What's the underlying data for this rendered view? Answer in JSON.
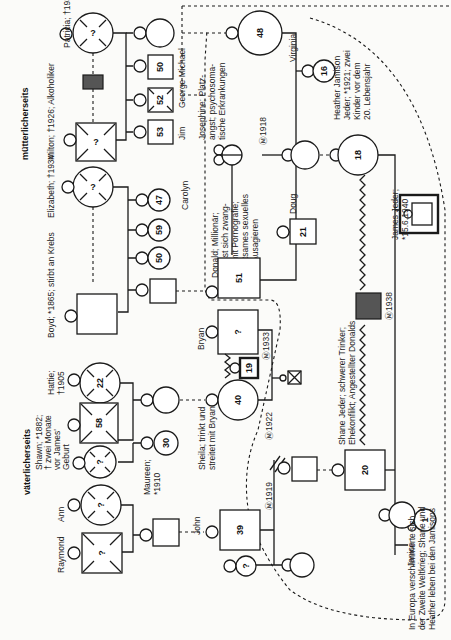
{
  "orientation": "rotated-90-ccw",
  "headers": {
    "maternal": "mütterlicherseits",
    "paternal": "väterlicherseits"
  },
  "persons": {
    "patricia": {
      "label": "Patricia; †1930",
      "age": "?",
      "sex": "female",
      "deceased": true
    },
    "milton": {
      "label": "Milton; †1926; Alkoholiker",
      "age": "?",
      "sex": "male",
      "deceased": true
    },
    "elizabeth": {
      "label": "Elizabeth; †1934",
      "age": "?",
      "sex": "female",
      "deceased": true
    },
    "boyd": {
      "label": "Boyd; *1865; stirbt an Krebs",
      "age": "",
      "sex": "male"
    },
    "hattie": {
      "label": "Hattie; †1905",
      "age": "22",
      "sex": "female",
      "deceased": true
    },
    "shawn": {
      "label": "Shawn; *1882; † zwei Monate vor James' Geburt",
      "age": "58",
      "sex": "male",
      "deceased": true
    },
    "maureen": {
      "label": "Maureen; *1910",
      "age": "30",
      "sex": "female"
    },
    "ann": {
      "label": "Ann",
      "age": "?",
      "sex": "female",
      "deceased": true
    },
    "raymond": {
      "label": "Raymond",
      "age": "?",
      "sex": "male",
      "deceased": true
    },
    "john": {
      "label": "John",
      "age": "",
      "sex": "male"
    },
    "george_michael": {
      "label": "George Michael",
      "age": "50",
      "sex": "male"
    },
    "jim": {
      "label": "Jim",
      "age": "53",
      "sex": "male"
    },
    "sibling_52": {
      "age": "52",
      "sex": "male",
      "deceased": true
    },
    "carolyn": {
      "label": "Carolyn",
      "age": "47",
      "sex": "female"
    },
    "sister_59": {
      "age": "59",
      "sex": "female"
    },
    "sister_50": {
      "age": "50",
      "sex": "female"
    },
    "josephine": {
      "label": "Josephine; Platzangst; psychosomatische Erkrankungen",
      "age": "48",
      "sex": "female"
    },
    "virginia": {
      "label": "Virginia",
      "age": "16",
      "sex": "female"
    },
    "donald": {
      "label": "Donald; Millionär; befasst sich zwanghaft mit Pornografie; seltsames sexuelles Ausagieren",
      "age": "51",
      "sex": "male"
    },
    "doug": {
      "label": "Doug",
      "age": "21",
      "sex": "male"
    },
    "heather": {
      "label": "Heather Jamison Jeder; *1921; zwei Kinder vor dem 20. Lebensjahr",
      "age": "18",
      "sex": "female"
    },
    "james": {
      "label": "James Jeder; *15.6.1940",
      "sex": "male",
      "index_person": true
    },
    "bryan": {
      "label": "Bryan",
      "age": "?",
      "sex": "male"
    },
    "child_19": {
      "age": "19",
      "sex": "male"
    },
    "sheila": {
      "label": "Sheila; trinkt und streitet mit Bryan",
      "age": "40",
      "sex": "female"
    },
    "person_39": {
      "age": "39",
      "sex": "male"
    },
    "shane": {
      "label": "Shane Jeder; schwerer Trinker; Ehekonflikt; Angestellter Donalds",
      "age": "20",
      "sex": "male"
    },
    "janice": {
      "label": "Janice",
      "age": "1",
      "sex": "female"
    },
    "unknown_girl": {
      "age": "?",
      "sex": "female"
    }
  },
  "marriages": {
    "m1918": "Ⓜ1918",
    "m1919": "Ⓜ1919",
    "m1922": "Ⓜ1922",
    "m1933": "Ⓜ1933",
    "m1938": "Ⓜ1938"
  },
  "note": "In Europa verschlimmerte sich der Zweite Weltkrieg; Shane und Heather leben bei den Jamisons",
  "colors": {
    "line": "#1a1a1a",
    "dark_fill": "#555555",
    "background": "#fbfbf9"
  }
}
